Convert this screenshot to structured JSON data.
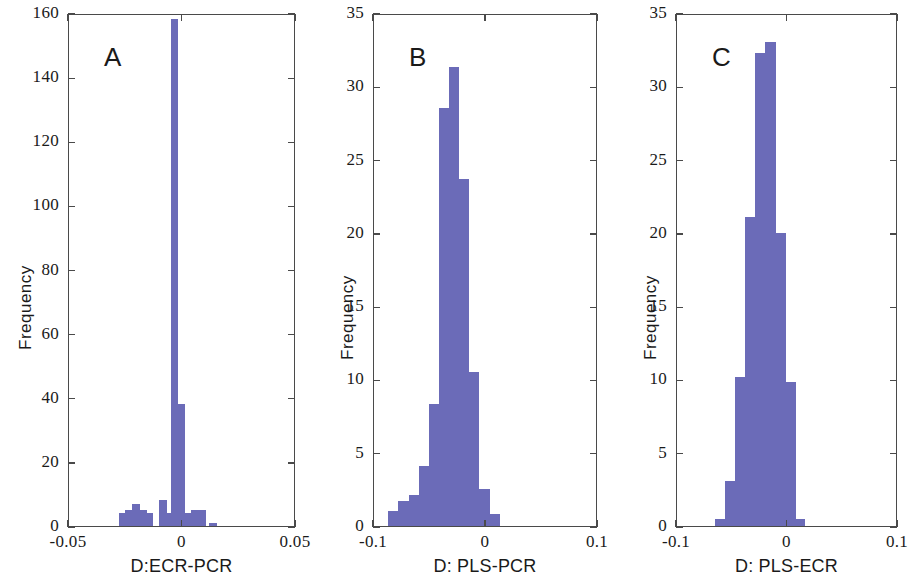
{
  "figure": {
    "width": 918,
    "height": 575,
    "background": "#ffffff",
    "bar_color": "#6b6bb8",
    "axis_color": "#4a4a4a"
  },
  "panels": [
    {
      "letter": "A",
      "ylabel": "Frequency",
      "xlabel": "D:ECR-PCR",
      "ytick_labels": [
        "0",
        "20",
        "40",
        "60",
        "80",
        "100",
        "120",
        "140",
        "160"
      ],
      "xtick_labels": [
        "-0.05",
        "0",
        "0.05"
      ]
    },
    {
      "letter": "B",
      "ylabel": "Frequency",
      "xlabel": "D: PLS-PCR",
      "ytick_labels": [
        "0",
        "5",
        "10",
        "15",
        "20",
        "25",
        "30",
        "35"
      ],
      "xtick_labels": [
        "-0.1",
        "0",
        "0.1"
      ]
    },
    {
      "letter": "C",
      "ylabel": "Frequency",
      "xlabel": "D: PLS-ECR",
      "ytick_labels": [
        "0",
        "5",
        "10",
        "15",
        "20",
        "25",
        "30",
        "35"
      ],
      "xtick_labels": [
        "-0.1",
        "0",
        "0.1"
      ]
    }
  ],
  "chart_data": [
    {
      "type": "bar",
      "title": "A",
      "xlabel": "D:ECR-PCR",
      "ylabel": "Frequency",
      "xlim": [
        -0.05,
        0.05
      ],
      "ylim": [
        0,
        160
      ],
      "yticks": [
        0,
        20,
        40,
        60,
        80,
        100,
        120,
        140,
        160
      ],
      "xticks": [
        -0.05,
        0,
        0.05
      ],
      "grid": false,
      "legend": "none",
      "bin_width": 0.0025,
      "x": [
        -0.0275,
        -0.025,
        -0.0225,
        -0.02,
        -0.0175,
        -0.015,
        -0.0125,
        -0.01,
        -0.0075,
        -0.005,
        -0.0025,
        0.0,
        0.0025,
        0.005,
        0.0075,
        0.01,
        0.0125
      ],
      "values": [
        0,
        4,
        5,
        7,
        5,
        4,
        0,
        8,
        4,
        158,
        38,
        0,
        4,
        5,
        5,
        0,
        1
      ],
      "categories": [
        "-0.0275",
        "-0.025",
        "-0.0225",
        "-0.02",
        "-0.0175",
        "-0.015",
        "-0.0125",
        "-0.01",
        "-0.0075",
        "-0.005",
        "-0.0025",
        "0",
        "0.0025",
        "0.005",
        "0.0075",
        "0.01",
        "0.0125"
      ]
    },
    {
      "type": "bar",
      "title": "B",
      "xlabel": "D: PLS-PCR",
      "ylabel": "Frequency",
      "xlim": [
        -0.1,
        0.1
      ],
      "ylim": [
        0,
        35
      ],
      "yticks": [
        0,
        5,
        10,
        15,
        20,
        25,
        30,
        35
      ],
      "xticks": [
        -0.1,
        0,
        0.1
      ],
      "grid": false,
      "legend": "none",
      "bin_width": 0.008,
      "x": [
        -0.082,
        -0.072,
        -0.063,
        -0.054,
        -0.045,
        -0.036,
        -0.027,
        -0.018,
        -0.009,
        0.0,
        0.009
      ],
      "values": [
        1,
        1.7,
        2.1,
        4.1,
        8.3,
        28.5,
        31.3,
        23.7,
        10.5,
        2.5,
        0.8
      ],
      "categories": [
        "-0.082",
        "-0.072",
        "-0.063",
        "-0.054",
        "-0.045",
        "-0.036",
        "-0.027",
        "-0.018",
        "-0.009",
        "0",
        "0.009"
      ]
    },
    {
      "type": "bar",
      "title": "C",
      "xlabel": "D: PLS-ECR",
      "ylabel": "Frequency",
      "xlim": [
        -0.1,
        0.1
      ],
      "ylim": [
        0,
        35
      ],
      "yticks": [
        0,
        5,
        10,
        15,
        20,
        25,
        30,
        35
      ],
      "xticks": [
        -0.1,
        0,
        0.1
      ],
      "grid": false,
      "legend": "none",
      "bin_width": 0.008,
      "x": [
        -0.059,
        -0.05,
        -0.041,
        -0.032,
        -0.023,
        -0.014,
        -0.005,
        0.004
      ],
      "values": [
        0.5,
        3.1,
        10.2,
        21.1,
        32.3,
        33.0,
        20.0,
        9.8
      ],
      "categories": [
        "-0.059",
        "-0.05",
        "-0.041",
        "-0.032",
        "-0.023",
        "-0.014",
        "-0.005",
        "0.004"
      ]
    }
  ],
  "panel_bars": {
    "A": [
      {
        "x": -0.0295,
        "h": 0
      },
      {
        "x": -0.0265,
        "h": 4
      },
      {
        "x": -0.0235,
        "h": 5
      },
      {
        "x": -0.0205,
        "h": 7
      },
      {
        "x": -0.0175,
        "h": 5
      },
      {
        "x": -0.0145,
        "h": 4
      },
      {
        "x": -0.0115,
        "h": 0
      },
      {
        "x": -0.0085,
        "h": 8
      },
      {
        "x": -0.0055,
        "h": 4
      },
      {
        "x": -0.0035,
        "h": 158
      },
      {
        "x": -0.0005,
        "h": 38
      },
      {
        "x": 0.0025,
        "h": 4
      },
      {
        "x": 0.0055,
        "h": 5
      },
      {
        "x": 0.0085,
        "h": 5
      },
      {
        "x": 0.0135,
        "h": 1
      }
    ],
    "B": [
      {
        "x": -0.0825,
        "h": 1
      },
      {
        "x": -0.0735,
        "h": 1.7
      },
      {
        "x": -0.0645,
        "h": 2.1
      },
      {
        "x": -0.0555,
        "h": 4.1
      },
      {
        "x": -0.0465,
        "h": 8.3
      },
      {
        "x": -0.0375,
        "h": 28.5
      },
      {
        "x": -0.0285,
        "h": 31.3
      },
      {
        "x": -0.0195,
        "h": 23.7
      },
      {
        "x": -0.0105,
        "h": 10.5
      },
      {
        "x": -0.0015,
        "h": 2.5
      },
      {
        "x": 0.0075,
        "h": 0.8
      }
    ],
    "C": [
      {
        "x": -0.0605,
        "h": 0.5
      },
      {
        "x": -0.0515,
        "h": 3.1
      },
      {
        "x": -0.0425,
        "h": 10.2
      },
      {
        "x": -0.0335,
        "h": 21.1
      },
      {
        "x": -0.0245,
        "h": 32.3
      },
      {
        "x": -0.0155,
        "h": 33.0
      },
      {
        "x": -0.0065,
        "h": 20.0
      },
      {
        "x": 0.0025,
        "h": 9.8
      },
      {
        "x": 0.0115,
        "h": 0.5
      }
    ]
  }
}
